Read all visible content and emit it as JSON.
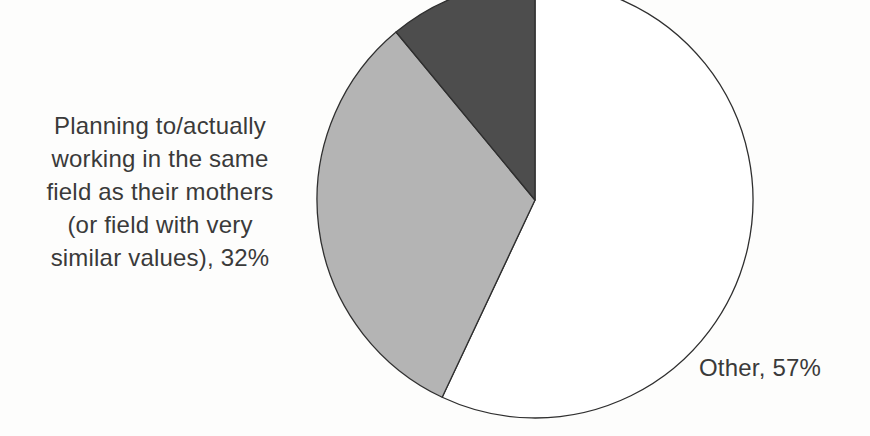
{
  "chart_data": {
    "type": "pie",
    "title": "",
    "start_angle_deg": 0,
    "direction": "clockwise",
    "stroke_color": "#2f2f2f",
    "background_color": "#fdfdfc",
    "text_color": "#3a3a3a",
    "legend_position": "none",
    "labels_outside": true,
    "slices": [
      {
        "label": "Other",
        "value": 57,
        "color": "#ffffff",
        "display_label": "Other, 57%"
      },
      {
        "label": "Planning to/actually working in the same field as their mothers (or field with very similar values)",
        "value": 32,
        "color": "#b4b4b4",
        "display_label": "Planning to/actually working in the same field as their mothers (or field with very similar values), 32%"
      },
      {
        "label": "",
        "value": 11,
        "color": "#4d4d4d",
        "display_label": ""
      }
    ]
  },
  "labels": {
    "planning": {
      "lines": [
        "Planning to/actually",
        "working in the same",
        "field as their mothers",
        "(or field with very",
        "similar values), 32%"
      ]
    },
    "other": {
      "text": "Other, 57%"
    }
  }
}
